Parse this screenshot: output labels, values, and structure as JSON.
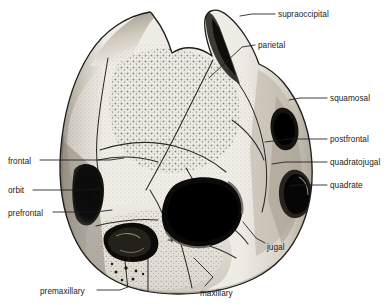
{
  "figure": {
    "background_color": "#ffffff",
    "ink_color": "#1b1b1b",
    "label_color": "#1b1b1b",
    "bone_fill_light": "#f2efe9",
    "bone_fill_mid": "#d9d4ca",
    "bone_fill_dark": "#a79f93",
    "opening_fill": "#0b0b0b",
    "width": 389,
    "height": 305
  },
  "labels": [
    {
      "id": "supraoccipital",
      "text": "supraoccipital",
      "side": "right",
      "text_x": 278,
      "text_y": 10,
      "leader": [
        [
          275,
          14
        ],
        [
          252,
          14
        ],
        [
          240,
          16
        ]
      ]
    },
    {
      "id": "parietal",
      "text": "parietal",
      "side": "right",
      "text_x": 258,
      "text_y": 41,
      "leader": [
        [
          255,
          45
        ],
        [
          242,
          47
        ],
        [
          209,
          78
        ]
      ]
    },
    {
      "id": "squamosal",
      "text": "squamosal",
      "side": "right",
      "text_x": 330,
      "text_y": 94,
      "leader": [
        [
          327,
          98
        ],
        [
          300,
          98
        ],
        [
          289,
          100
        ]
      ]
    },
    {
      "id": "postfrontal",
      "text": "postfrontal",
      "side": "right",
      "text_x": 330,
      "text_y": 135,
      "leader": [
        [
          327,
          139
        ],
        [
          290,
          139
        ],
        [
          265,
          142
        ]
      ]
    },
    {
      "id": "quadratojugal",
      "text": "quadratojugal",
      "side": "right",
      "text_x": 330,
      "text_y": 158,
      "leader": [
        [
          327,
          162
        ],
        [
          285,
          162
        ],
        [
          272,
          164
        ]
      ]
    },
    {
      "id": "quadrate",
      "text": "quadrate",
      "side": "right",
      "text_x": 330,
      "text_y": 181,
      "leader": [
        [
          327,
          185
        ],
        [
          297,
          185
        ],
        [
          290,
          186
        ]
      ]
    },
    {
      "id": "jugal",
      "text": "jugal",
      "side": "right",
      "text_x": 267,
      "text_y": 243,
      "leader": [
        [
          265,
          243
        ],
        [
          256,
          238
        ],
        [
          243,
          222
        ]
      ]
    },
    {
      "id": "maxillary",
      "text": "maxillary",
      "side": "right",
      "text_x": 200,
      "text_y": 289,
      "leader": [
        [
          205,
          286
        ],
        [
          213,
          277
        ],
        [
          194,
          258
        ]
      ]
    },
    {
      "id": "premaxillary",
      "text": "premaxillary",
      "side": "left",
      "text_x": 40,
      "text_y": 287,
      "leader": [
        [
          97,
          290
        ],
        [
          120,
          290
        ],
        [
          128,
          287
        ]
      ]
    },
    {
      "id": "prefrontal",
      "text": "prefrontal",
      "side": "left",
      "text_x": 8,
      "text_y": 209,
      "leader": [
        [
          53,
          212
        ],
        [
          95,
          212
        ],
        [
          112,
          210
        ]
      ]
    },
    {
      "id": "orbit",
      "text": "orbit",
      "side": "left",
      "text_x": 8,
      "text_y": 186,
      "leader": [
        [
          33,
          190
        ],
        [
          88,
          190
        ],
        [
          100,
          189
        ]
      ]
    },
    {
      "id": "frontal",
      "text": "frontal",
      "side": "left",
      "text_x": 8,
      "text_y": 157,
      "leader": [
        [
          40,
          160
        ],
        [
          110,
          160
        ],
        [
          124,
          158
        ]
      ]
    }
  ]
}
